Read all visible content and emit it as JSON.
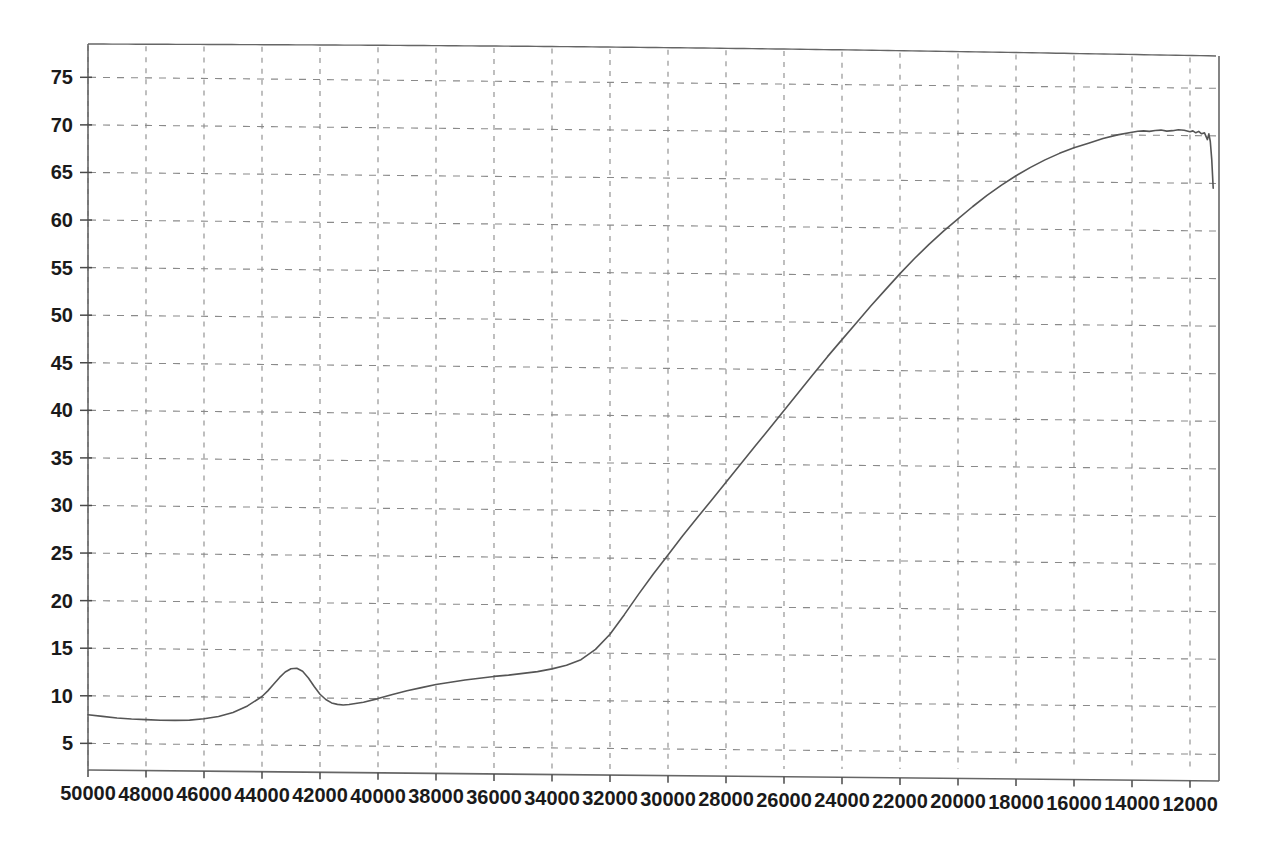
{
  "chart_data": {
    "type": "line",
    "title": "",
    "subtitle": "",
    "xlabel": "",
    "ylabel": "",
    "xlim": [
      50000,
      11000
    ],
    "ylim": [
      2.2,
      78.5
    ],
    "x_axis_reversed": true,
    "grid": true,
    "grid_style": "dashed",
    "legend": null,
    "legend_position": "none",
    "xticks": [
      50000,
      48000,
      46000,
      44000,
      42000,
      40000,
      38000,
      36000,
      34000,
      32000,
      30000,
      28000,
      26000,
      24000,
      22000,
      20000,
      18000,
      16000,
      14000,
      12000
    ],
    "xtick_labels": [
      "50000",
      "48000",
      "46000",
      "44000",
      "42000",
      "40000",
      "38000",
      "36000",
      "34000",
      "32000",
      "30000",
      "28000",
      "26000",
      "24000",
      "22000",
      "20000",
      "18000",
      "16000",
      "14000",
      "12000"
    ],
    "yticks": [
      5,
      10,
      15,
      20,
      25,
      30,
      35,
      40,
      45,
      50,
      55,
      60,
      65,
      70,
      75
    ],
    "ytick_labels": [
      "5",
      "10",
      "15",
      "20",
      "25",
      "30",
      "35",
      "40",
      "45",
      "50",
      "55",
      "60",
      "65",
      "70",
      "75"
    ],
    "line_color": "#555555",
    "line_width": 1.6,
    "series": [
      {
        "name": "spectrum",
        "x": [
          50000,
          49500,
          49000,
          48500,
          48000,
          47500,
          47000,
          46500,
          46000,
          45500,
          45000,
          44500,
          44000,
          43800,
          43600,
          43400,
          43200,
          43000,
          42800,
          42600,
          42400,
          42200,
          42000,
          41800,
          41600,
          41400,
          41200,
          41000,
          40500,
          40000,
          39500,
          39000,
          38500,
          38000,
          37500,
          37000,
          36500,
          36000,
          35500,
          35000,
          34500,
          34000,
          33500,
          33000,
          32500,
          32000,
          31500,
          31000,
          30500,
          30000,
          29500,
          29000,
          28500,
          28000,
          27500,
          27000,
          26500,
          26000,
          25500,
          25000,
          24500,
          24000,
          23500,
          23000,
          22500,
          22000,
          21500,
          21000,
          20500,
          20000,
          19500,
          19000,
          18500,
          18000,
          17500,
          17000,
          16500,
          16000,
          15500,
          15000,
          14500,
          14000,
          13800,
          13600,
          13400,
          13200,
          13000,
          12800,
          12600,
          12400,
          12200,
          12000,
          11900,
          11800,
          11700,
          11600,
          11500,
          11400,
          11350,
          11300,
          11250,
          11200
        ],
        "y": [
          8.0,
          7.85,
          7.7,
          7.6,
          7.55,
          7.5,
          7.5,
          7.55,
          7.7,
          7.95,
          8.4,
          9.1,
          10.1,
          10.7,
          11.4,
          12.1,
          12.7,
          13.05,
          13.1,
          12.8,
          12.1,
          11.2,
          10.4,
          9.85,
          9.5,
          9.35,
          9.3,
          9.35,
          9.6,
          10.0,
          10.45,
          10.85,
          11.2,
          11.55,
          11.8,
          12.05,
          12.25,
          12.45,
          12.6,
          12.8,
          13.0,
          13.3,
          13.7,
          14.3,
          15.4,
          17.0,
          19.1,
          21.3,
          23.4,
          25.4,
          27.4,
          29.3,
          31.2,
          33.1,
          35.0,
          36.9,
          38.8,
          40.7,
          42.6,
          44.5,
          46.4,
          48.2,
          50.0,
          51.8,
          53.5,
          55.2,
          56.8,
          58.3,
          59.7,
          61.0,
          62.3,
          63.5,
          64.6,
          65.6,
          66.5,
          67.3,
          68.0,
          68.6,
          69.1,
          69.6,
          70.0,
          70.3,
          70.4,
          70.45,
          70.4,
          70.5,
          70.55,
          70.45,
          70.5,
          70.6,
          70.55,
          70.4,
          70.5,
          70.3,
          70.45,
          70.2,
          70.3,
          69.6,
          70.2,
          69.4,
          67.5,
          64.5
        ]
      }
    ],
    "annotations": [
      {
        "label": "local-peak",
        "x": 43000,
        "y": 13.1
      },
      {
        "label": "local-trough",
        "x": 41200,
        "y": 9.3
      },
      {
        "label": "plateau-max",
        "x": 12400,
        "y": 70.6
      },
      {
        "label": "start-value",
        "x": 50000,
        "y": 8.0
      }
    ]
  },
  "axes": {
    "frame_color": "#666666",
    "grid_color": "#8a8a8a",
    "tick_color": "#4a4a4a",
    "background": "#ffffff"
  }
}
